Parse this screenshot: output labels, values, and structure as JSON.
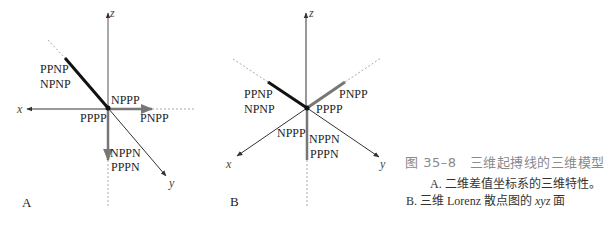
{
  "figure": {
    "title": "图 35–8　三维起搏线的三维模型",
    "caption_a": "A. 二维差值坐标系的三维特性。",
    "caption_b_prefix": "B. 三维 Lorenz 散点图的 ",
    "caption_b_italic": "xyz",
    "caption_b_suffix": " 面"
  },
  "panels": {
    "A": {
      "label": "A",
      "axes": {
        "x": "x",
        "y": "y",
        "z": "z"
      },
      "points": {
        "ppnp": "PPNP",
        "npnp": "NPNP",
        "nppp": "NPPP",
        "pppp": "PPPP",
        "pnpp": "PNPP",
        "nppn": "NPPN",
        "pppn": "PPPN"
      }
    },
    "B": {
      "label": "B",
      "axes": {
        "x": "x",
        "y": "y",
        "z": "z"
      },
      "points": {
        "ppnp": "PPNP",
        "npnp": "NPNP",
        "pnpp": "PNPP",
        "pppp": "PPPP",
        "nppp": "NPPP",
        "nppn": "NPPN",
        "pppn": "PPPN"
      }
    }
  },
  "colors": {
    "axis": "#333333",
    "thick_dark": "#111111",
    "thick_gray": "#777777",
    "dotted": "#aaaaaa",
    "title": "#8a8a8a"
  }
}
